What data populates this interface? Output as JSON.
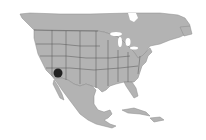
{
  "map": {
    "region": "North America",
    "colors": {
      "background": "#ffffff",
      "land": "#b3b3b3",
      "border": "#555555",
      "marker": "#222222"
    },
    "markers": [
      {
        "name": "occurrence-dot",
        "x": 58,
        "y": 73,
        "r": 4.5
      }
    ]
  }
}
